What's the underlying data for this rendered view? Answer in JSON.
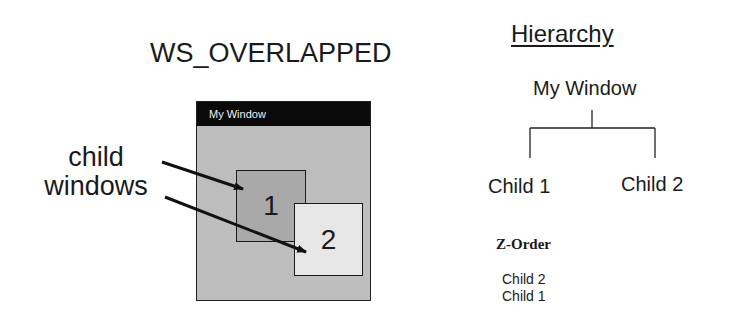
{
  "diagram": {
    "title": "WS_OVERLAPPED",
    "annotation": {
      "line1": "child",
      "line2": "windows"
    },
    "window": {
      "title": "My Window",
      "children": [
        {
          "label": "1",
          "name": "Child 1"
        },
        {
          "label": "2",
          "name": "Child 2"
        }
      ]
    },
    "hierarchy": {
      "heading": "Hierarchy",
      "root": "My Window",
      "children": [
        "Child 1",
        "Child 2"
      ]
    },
    "z_order": {
      "heading": "Z-Order",
      "items": [
        "Child 2",
        "Child 1"
      ]
    },
    "colors": {
      "title_bar": "#0a0a0a",
      "client_area": "#bdbdbd",
      "child1_fill": "#a9a9a9",
      "child2_fill": "#e6e6e6"
    }
  }
}
